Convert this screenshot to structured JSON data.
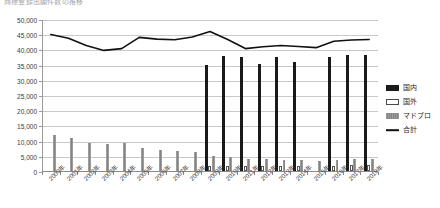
{
  "chart": {
    "title": "商標登録出願件数の推移",
    "legend_position": "right"
  },
  "legend": [
    {
      "label": "国内",
      "key": "domestic",
      "color": "#1a1a1a"
    },
    {
      "label": "国外",
      "key": "foreign",
      "color": "#ffffff"
    },
    {
      "label": "マドプロ",
      "key": "madopro",
      "color": "#8f8f8f"
    },
    {
      "label": "合計",
      "key": "total",
      "color": "#111111"
    }
  ],
  "chart_data": {
    "type": "bar",
    "title": "商標登録出願件数の推移",
    "xlabel": "",
    "ylabel": "",
    "ylim": [
      0,
      50000
    ],
    "ytick_interval": 5000,
    "grid": true,
    "legend_position": "right",
    "categories": [
      "2000年",
      "2001年",
      "2002年",
      "2003年",
      "2004年",
      "2005年",
      "2006年",
      "2007年",
      "2008年",
      "2009年",
      "2010年",
      "2011年",
      "2012年",
      "2013年",
      "2014年",
      "2015年",
      "2016年",
      "2017年",
      "2018年"
    ],
    "ytick_labels": [
      "0",
      "5,000",
      "10,000",
      "15,000",
      "20,000",
      "25,000",
      "30,000",
      "35,000",
      "40,000",
      "45,000",
      "50,000"
    ],
    "series": [
      {
        "name": "国内",
        "type": "bar",
        "color": "#1a1a1a",
        "values": [
          0,
          0,
          0,
          0,
          0,
          0,
          0,
          0,
          0,
          35000,
          37800,
          37600,
          35200,
          37600,
          36000,
          0,
          37400,
          38000,
          38200
        ]
      },
      {
        "name": "国外",
        "type": "bar",
        "color": "#ffffff",
        "values": [
          0,
          0,
          0,
          0,
          0,
          0,
          0,
          0,
          0,
          1600,
          1700,
          1800,
          1700,
          1500,
          1500,
          0,
          1600,
          2000,
          2000
        ]
      },
      {
        "name": "マドプロ",
        "type": "bar",
        "color": "#8f8f8f",
        "values": [
          11700,
          10800,
          9200,
          8900,
          9200,
          7700,
          7000,
          6600,
          6100,
          4800,
          4700,
          4100,
          3900,
          3700,
          3700,
          3300,
          3700,
          4000,
          4100
        ]
      },
      {
        "name": "合計",
        "type": "line",
        "color": "#111111",
        "values": [
          45200,
          44000,
          41600,
          40000,
          40600,
          44300,
          43700,
          43500,
          44400,
          46200,
          43600,
          40600,
          41200,
          41600,
          41300,
          40900,
          43000,
          43400,
          43600
        ]
      }
    ]
  }
}
